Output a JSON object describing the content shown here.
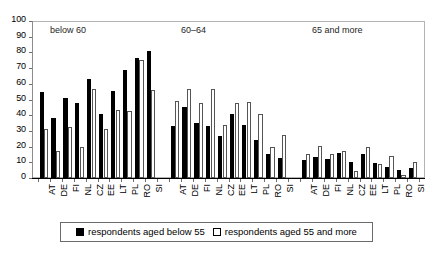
{
  "chart_data": {
    "type": "bar",
    "title": "",
    "subtitle": "",
    "xlabel": "",
    "ylabel": "",
    "ylim": [
      0,
      100
    ],
    "ytick_step": 10,
    "yticks": [
      0,
      10,
      20,
      30,
      40,
      50,
      60,
      70,
      80,
      90,
      100
    ],
    "ytick_labels": [
      "0",
      "10",
      "20",
      "30",
      "40",
      "50",
      "60",
      "70",
      "80",
      "90",
      "100"
    ],
    "grid": false,
    "legend_position": "bottom",
    "orientation": "vertical",
    "categories": [
      "AT",
      "DE",
      "FI",
      "NL",
      "CZ",
      "EE",
      "LT",
      "PL",
      "RO",
      "SI"
    ],
    "panels": [
      {
        "label": "below 60",
        "categories": [
          "AT",
          "DE",
          "FI",
          "NL",
          "CZ",
          "EE",
          "LT",
          "PL",
          "RO",
          "SI"
        ],
        "series": [
          {
            "name": "respondents aged below 55",
            "color": "#000000",
            "values": [
              55,
              38.5,
              51,
              47.5,
              63,
              40.5,
              55.5,
              69,
              76.5,
              81
            ]
          },
          {
            "name": "respondents aged 55 and more",
            "color": "#ffffff",
            "values": [
              31.5,
              17,
              32.5,
              20,
              56.5,
              31,
              43.5,
              42.5,
              75,
              56
            ]
          }
        ]
      },
      {
        "label": "60–64",
        "categories": [
          "AT",
          "DE",
          "FI",
          "NL",
          "CZ",
          "EE",
          "LT",
          "PL",
          "RO",
          "SI"
        ],
        "series": [
          {
            "name": "respondents aged below 55",
            "color": "#000000",
            "values": [
              33,
              45,
              35,
              33,
              27,
              41,
              34,
              24,
              15,
              12.5
            ]
          },
          {
            "name": "respondents aged 55 and more",
            "color": "#ffffff",
            "values": [
              49,
              56.5,
              48,
              57,
              34,
              47.5,
              48.5,
              41,
              20,
              27.5
            ]
          }
        ]
      },
      {
        "label": "65 and more",
        "categories": [
          "AT",
          "DE",
          "FI",
          "NL",
          "CZ",
          "EE",
          "LT",
          "PL",
          "RO",
          "SI"
        ],
        "series": [
          {
            "name": "respondents aged below 55",
            "color": "#000000",
            "values": [
              11.5,
              13.5,
              12,
              16,
              10.5,
              15.5,
              9.5,
              7,
              5,
              6.5
            ]
          },
          {
            "name": "respondents aged 55 and more",
            "color": "#ffffff",
            "values": [
              15,
              20.5,
              15.5,
              17.5,
              4.5,
              19.5,
              9,
              14,
              2,
              10
            ]
          }
        ]
      }
    ],
    "legend": [
      {
        "label": "respondents aged below 55",
        "swatch": "dark"
      },
      {
        "label": "respondents aged 55 and more",
        "swatch": "light"
      }
    ]
  }
}
